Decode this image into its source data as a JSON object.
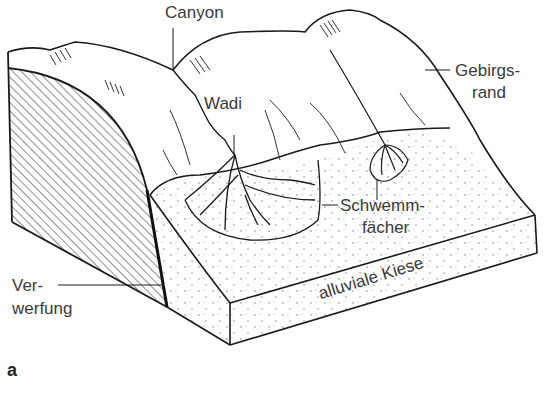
{
  "figure": {
    "panel_label": "a",
    "labels": {
      "canyon": "Canyon",
      "wadi": "Wadi",
      "gebirgsrand_line1": "Gebirgs-",
      "gebirgsrand_line2": "rand",
      "schwemm_line1": "Schwemm-",
      "schwemm_line2": "fächer",
      "verwerfung_line1": "Ver-",
      "verwerfung_line2": "werfung",
      "alluvial": "alluviale Kiese"
    },
    "colors": {
      "line": "#1a1a1a",
      "text": "#3a3a3a",
      "background": "#ffffff"
    }
  }
}
